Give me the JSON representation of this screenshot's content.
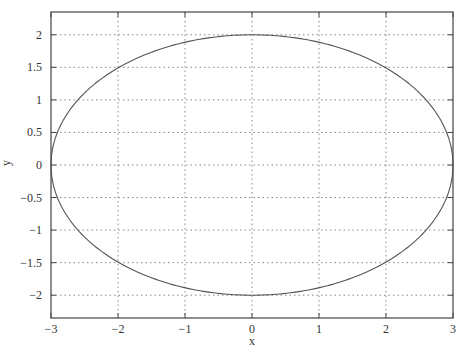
{
  "chart_data": {
    "type": "line",
    "title": "",
    "xlabel": "x",
    "ylabel": "y",
    "xlim": [
      -3,
      3
    ],
    "ylim": [
      -2.35,
      2.35
    ],
    "grid": true,
    "legend": null,
    "x_ticks": [
      -3,
      -2,
      -1,
      0,
      1,
      2,
      3
    ],
    "x_tick_labels": [
      "−3",
      "−2",
      "−1",
      "0",
      "1",
      "2",
      "3"
    ],
    "y_ticks": [
      -2,
      -1.5,
      -1,
      -0.5,
      0,
      0.5,
      1,
      1.5,
      2
    ],
    "y_tick_labels": [
      "−2",
      "−1.5",
      "−1",
      "−0.5",
      "0",
      "0.5",
      "1",
      "1.5",
      "2"
    ],
    "series": [
      {
        "name": "ellipse",
        "description": "Parametric ellipse x = 3 cos t, y = 2 sin t",
        "semi_axis_x": 3,
        "semi_axis_y": 2,
        "center": [
          0,
          0
        ],
        "color": "#555555",
        "x": [
          3,
          2.598,
          1.5,
          0,
          -1.5,
          -2.598,
          -3,
          -2.598,
          -1.5,
          0,
          1.5,
          2.598,
          3
        ],
        "y": [
          0,
          1,
          1.732,
          2,
          1.732,
          1,
          0,
          -1,
          -1.732,
          -2,
          -1.732,
          -1,
          0
        ]
      }
    ]
  },
  "colors": {
    "axis": "#444444",
    "grid": "#888888",
    "curve": "#555555",
    "background": "#ffffff"
  }
}
